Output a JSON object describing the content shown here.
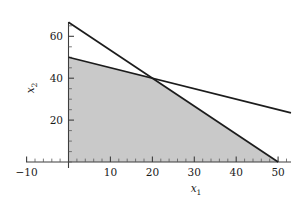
{
  "figure": {
    "name": "linear-programming-feasible-region",
    "background_color": "#ffffff"
  },
  "chart_data": {
    "type": "line",
    "title": "",
    "subtitle": "",
    "xlabel": "x₁",
    "ylabel": "x₂",
    "xlabel_base": "x",
    "xlabel_sub": "1",
    "ylabel_base": "x",
    "ylabel_sub": "2",
    "xlim": [
      -14,
      53
    ],
    "ylim": [
      -5,
      70
    ],
    "grid": false,
    "legend": "none",
    "xticks": [
      -10,
      10,
      20,
      30,
      40,
      50
    ],
    "xtick_labels": [
      "-10",
      "10",
      "20",
      "30",
      "40",
      "50"
    ],
    "yticks": [
      20,
      40,
      60
    ],
    "ytick_labels": [
      "20",
      "40",
      "60"
    ],
    "x_minor_step": 2,
    "y_minor_step": 5,
    "series": [
      {
        "name": "constraint-line-steep",
        "label": "4x₁ + 3x₂ = 200",
        "x": [
          0,
          50
        ],
        "y": [
          66.7,
          0
        ],
        "color": "#1c1c1c"
      },
      {
        "name": "constraint-line-shallow",
        "label": "x₁ + 2x₂ = 100",
        "x": [
          0,
          50
        ],
        "y": [
          50,
          25
        ],
        "color": "#1c1c1c"
      }
    ],
    "annotations": [
      {
        "name": "intersection-vertex",
        "x": 20,
        "y": 40,
        "label": ""
      }
    ],
    "shaded_region": {
      "name": "feasible-region",
      "color": "#c9c9c9",
      "vertices": [
        [
          0,
          0
        ],
        [
          0,
          50
        ],
        [
          20,
          40
        ],
        [
          50,
          0
        ]
      ]
    }
  }
}
